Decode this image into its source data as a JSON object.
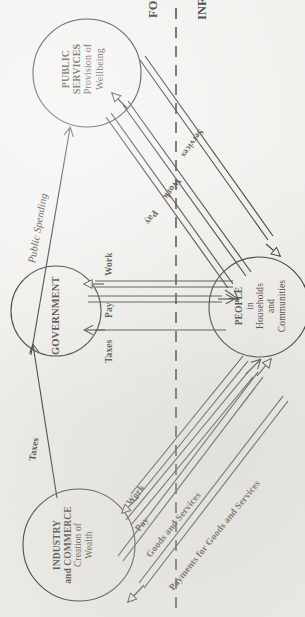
{
  "diagram": {
    "orientation": "rotated-90-ccw",
    "divider": {
      "left_label": "FORMAL",
      "right_label": "INFORMAL",
      "style": "dashed"
    },
    "nodes": [
      {
        "id": "public-services",
        "lines": [
          "PUBLIC",
          "SERVICES",
          "Provision of",
          "Wellbeing"
        ],
        "bold_lines": 2
      },
      {
        "id": "government",
        "lines": [
          "GOVERNMENT"
        ],
        "bold_lines": 1
      },
      {
        "id": "people",
        "lines": [
          "PEOPLE",
          "in",
          "Households",
          "and",
          "Communities"
        ],
        "bold_lines": 1
      },
      {
        "id": "industry-commerce",
        "lines": [
          "INDUSTRY",
          "and COMMERCE",
          "Creation of",
          "Wealth"
        ],
        "bold_lines": 2
      }
    ],
    "flows": [
      {
        "id": "public-spending",
        "label": "Public Spending",
        "from": "government",
        "to": "public-services",
        "style": "italic-single"
      },
      {
        "id": "taxes-industry",
        "label": "Taxes",
        "from": "industry-commerce",
        "to": "government",
        "style": "single"
      },
      {
        "id": "ps-services",
        "label": "Services",
        "from": "public-services",
        "to": "people",
        "style": "double"
      },
      {
        "id": "ps-work",
        "label": "Work",
        "from": "people",
        "to": "public-services",
        "style": "double"
      },
      {
        "id": "ps-pay",
        "label": "Pay",
        "from": "public-services",
        "to": "people",
        "style": "double"
      },
      {
        "id": "gov-work",
        "label": "Work",
        "from": "people",
        "to": "government",
        "style": "double"
      },
      {
        "id": "gov-pay",
        "label": "Pay",
        "from": "government",
        "to": "people",
        "style": "double"
      },
      {
        "id": "gov-taxes",
        "label": "Taxes",
        "from": "people",
        "to": "government",
        "style": "single"
      },
      {
        "id": "ind-work",
        "label": "Work",
        "from": "people",
        "to": "industry-commerce",
        "style": "double"
      },
      {
        "id": "ind-pay",
        "label": "Pay",
        "from": "industry-commerce",
        "to": "people",
        "style": "double"
      },
      {
        "id": "ind-goods",
        "label": "Goods and Services",
        "from": "industry-commerce",
        "to": "people",
        "style": "double"
      },
      {
        "id": "ind-payments",
        "label": "Payments for Goods and Services",
        "from": "people",
        "to": "industry-commerce",
        "style": "double"
      }
    ],
    "colors": {
      "ink": "#16140f",
      "paper": "#f0efec"
    }
  }
}
